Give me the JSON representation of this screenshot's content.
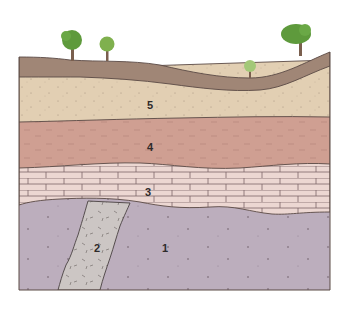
{
  "diagram": {
    "type": "geologic cross-section",
    "layers": [
      {
        "id": "1",
        "label": "1",
        "description": "igneous/basement rock (stippled purple)",
        "color": "#bcaebd"
      },
      {
        "id": "2",
        "label": "2",
        "description": "dike intrusion (dashed grey)",
        "color": "#ccc6c4"
      },
      {
        "id": "3",
        "label": "3",
        "description": "limestone (brick pattern)",
        "color": "#ecd7d2"
      },
      {
        "id": "4",
        "label": "4",
        "description": "shale (red, dashed)",
        "color": "#cf9f92"
      },
      {
        "id": "5",
        "label": "5",
        "description": "sandstone (stippled tan)",
        "color": "#e2cfb3"
      },
      {
        "id": "soil",
        "label": "",
        "description": "topsoil",
        "color": "#a08676"
      }
    ],
    "trees": [
      {
        "name": "tree-1",
        "color": "#5e9a3c"
      },
      {
        "name": "tree-2",
        "color": "#7fb04e"
      },
      {
        "name": "tree-3",
        "color": "#a3c878"
      },
      {
        "name": "tree-4",
        "color": "#5e9a3c"
      }
    ],
    "outline_color": "#5a4a45",
    "trunk_color": "#7a5f4e"
  }
}
